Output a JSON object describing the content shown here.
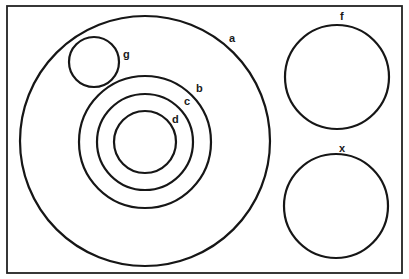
{
  "diagram": {
    "type": "venn-euler",
    "frame": {
      "x": 7,
      "y": 6,
      "width": 395,
      "height": 267
    },
    "stroke_color": "#161616",
    "sets": [
      {
        "id": "a",
        "label": "a",
        "cx": 145,
        "cy": 141,
        "r": 125,
        "label_x": 229,
        "label_y": 42,
        "contains": [
          "b",
          "g"
        ]
      },
      {
        "id": "b",
        "label": "b",
        "cx": 145,
        "cy": 142,
        "r": 66,
        "label_x": 196,
        "label_y": 92,
        "contains": [
          "c"
        ]
      },
      {
        "id": "c",
        "label": "c",
        "cx": 145,
        "cy": 142,
        "r": 48,
        "label_x": 184,
        "label_y": 105,
        "contains": [
          "d"
        ]
      },
      {
        "id": "d",
        "label": "d",
        "cx": 145,
        "cy": 142,
        "r": 31,
        "label_x": 172,
        "label_y": 123,
        "contains": []
      },
      {
        "id": "g",
        "label": "g",
        "cx": 94,
        "cy": 62,
        "r": 25,
        "label_x": 123,
        "label_y": 58,
        "contains": []
      },
      {
        "id": "f",
        "label": "f",
        "cx": 337,
        "cy": 77,
        "r": 52,
        "label_x": 340,
        "label_y": 20,
        "contains": []
      },
      {
        "id": "x",
        "label": "x",
        "cx": 336,
        "cy": 206,
        "r": 52,
        "label_x": 339,
        "label_y": 152,
        "contains": []
      }
    ]
  }
}
